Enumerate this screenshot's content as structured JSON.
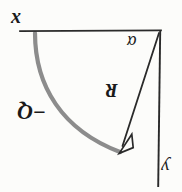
{
  "figure": {
    "background_color": "#fcfcfa",
    "ink_color": "#1a1a1a",
    "arc_color": "#8c8c8c",
    "labels": {
      "x_axis": "x",
      "y_axis": "y",
      "angle": "α",
      "radius": "R",
      "charge": "−Q"
    },
    "orientation_note": "180-degree rotated",
    "geometry": {
      "horizontal_axis": {
        "x1": 20,
        "y1": 31,
        "x2": 161,
        "y2": 31
      },
      "vertical_axis": {
        "x1": 160,
        "y1": 31,
        "x2": 158,
        "y2": 186
      },
      "radius_vector": {
        "x1": 159,
        "y1": 33,
        "x2": 120,
        "y2": 152
      },
      "arc": {
        "start_x": 35,
        "start_y": 33,
        "end_x": 120,
        "end_y": 152,
        "radius": 122
      },
      "arrowhead": {
        "tip_x": 120,
        "tip_y": 152,
        "style": "open-triangle"
      }
    }
  }
}
